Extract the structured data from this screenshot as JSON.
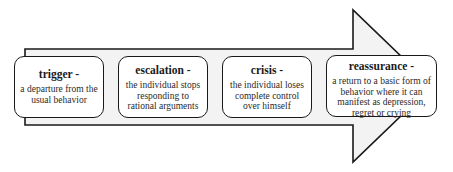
{
  "diagram": {
    "type": "process-arrow",
    "arrow": {
      "fill": "#f3f3f3",
      "stroke": "#1a1a1a"
    },
    "stages": [
      {
        "title": "trigger -",
        "description": "a departure from the usual behavior"
      },
      {
        "title": "escalation -",
        "description": "the individual stops responding to rational arguments"
      },
      {
        "title": "crisis -",
        "description": "the individual loses complete control over himself"
      },
      {
        "title": "reassurance -",
        "description": "a return to a basic form of behavior where it can manifest as depression, regret or crying"
      }
    ]
  }
}
